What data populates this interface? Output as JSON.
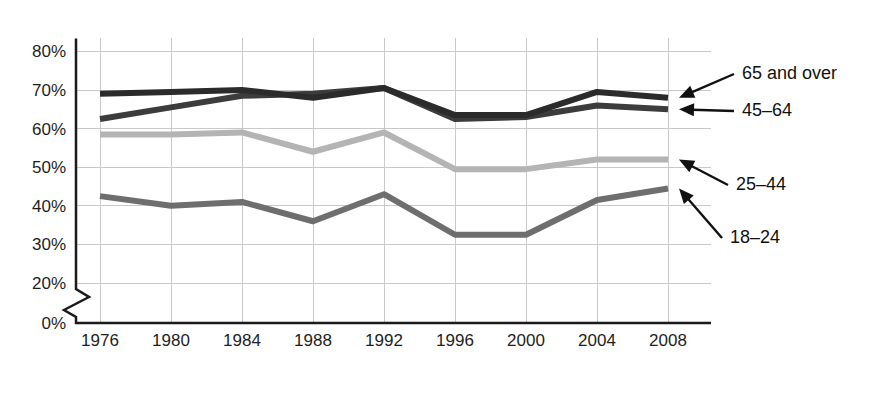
{
  "chart_data": {
    "type": "line",
    "title": "",
    "subtitle": "",
    "xlabel": "",
    "ylabel": "",
    "x": [
      1976,
      1980,
      1984,
      1988,
      1992,
      1996,
      2000,
      2004,
      2008
    ],
    "categories": [
      "1976",
      "1980",
      "1984",
      "1988",
      "1992",
      "1996",
      "2000",
      "2004",
      "2008"
    ],
    "ylim": [
      0,
      80
    ],
    "yticks": [
      0,
      20,
      30,
      40,
      50,
      60,
      70,
      80
    ],
    "ytick_labels": [
      "0%",
      "20%",
      "30%",
      "40%",
      "50%",
      "60%",
      "70%",
      "80%"
    ],
    "y_axis_break": true,
    "y_axis_break_between": [
      0,
      20
    ],
    "grid": true,
    "legend_position": "right-annotations",
    "units": "percent",
    "series": [
      {
        "name": "65 and over",
        "color": "#2b2b2b",
        "values": [
          69.0,
          69.5,
          70.0,
          68.0,
          70.5,
          63.5,
          63.5,
          69.5,
          68.0
        ]
      },
      {
        "name": "45–64",
        "color": "#3c3c3c",
        "values": [
          62.5,
          65.5,
          68.5,
          69.0,
          70.5,
          62.5,
          63.0,
          66.0,
          65.0
        ]
      },
      {
        "name": "25–44",
        "color": "#b4b4b4",
        "values": [
          58.5,
          58.5,
          59.0,
          54.0,
          59.0,
          49.5,
          49.5,
          52.0,
          52.0
        ]
      },
      {
        "name": "18–24",
        "color": "#6e6e6e",
        "values": [
          42.5,
          40.0,
          41.0,
          36.0,
          43.0,
          32.5,
          32.5,
          41.5,
          44.5
        ]
      }
    ],
    "annotations": [
      {
        "label": "65 and over",
        "series": "65 and over",
        "text_x": 742,
        "text_y": 79
      },
      {
        "label": "45–64",
        "series": "45–64",
        "text_x": 742,
        "text_y": 116
      },
      {
        "label": "25–44",
        "series": "25–44",
        "text_x": 736,
        "text_y": 190
      },
      {
        "label": "18–24",
        "series": "18–24",
        "text_x": 730,
        "text_y": 243
      }
    ]
  },
  "axis": {
    "ytick_labels": [
      "80%",
      "70%",
      "60%",
      "50%",
      "40%",
      "30%",
      "20%",
      "0%"
    ],
    "xtick_labels": [
      "1976",
      "1980",
      "1984",
      "1988",
      "1992",
      "1996",
      "2000",
      "2004",
      "2008"
    ]
  },
  "annotations": {
    "label_65_and_over": "65 and over",
    "label_45_64": "45–64",
    "label_25_44": "25–44",
    "label_18_24": "18–24"
  },
  "colors": {
    "series_65_and_over": "#2b2b2b",
    "series_45_64": "#3c3c3c",
    "series_25_44": "#b4b4b4",
    "series_18_24": "#6e6e6e",
    "gridline": "#c9c9c9",
    "axis": "#1a1a1a",
    "background": "#ffffff"
  }
}
